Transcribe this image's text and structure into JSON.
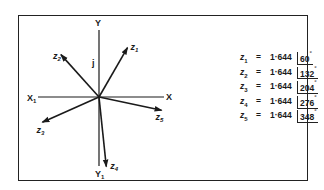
{
  "diagram": {
    "type": "phasor",
    "axes": {
      "positive_x_label": "X",
      "negative_x_label": "X",
      "negative_x_subscript": "1",
      "positive_y_label": "Y",
      "negative_y_label": "Y",
      "negative_y_subscript": "1",
      "imaginary_unit_label": "j"
    },
    "phasors": [
      {
        "name": "z",
        "index": "1",
        "magnitude": "1·644",
        "angle": "60",
        "angle_deg": 60
      },
      {
        "name": "z",
        "index": "2",
        "magnitude": "1·644",
        "angle": "132",
        "angle_deg": 132
      },
      {
        "name": "z",
        "index": "3",
        "magnitude": "1·644",
        "angle": "204",
        "angle_deg": 204
      },
      {
        "name": "z",
        "index": "4",
        "magnitude": "1·644",
        "angle": "276",
        "angle_deg": 276
      },
      {
        "name": "z",
        "index": "5",
        "magnitude": "1·644",
        "angle": "348",
        "angle_deg": 348
      }
    ],
    "equals_sign": "=",
    "degree_symbol": "°",
    "colors": {
      "ink": "#1a1a1a",
      "background": "#ffffff"
    }
  }
}
